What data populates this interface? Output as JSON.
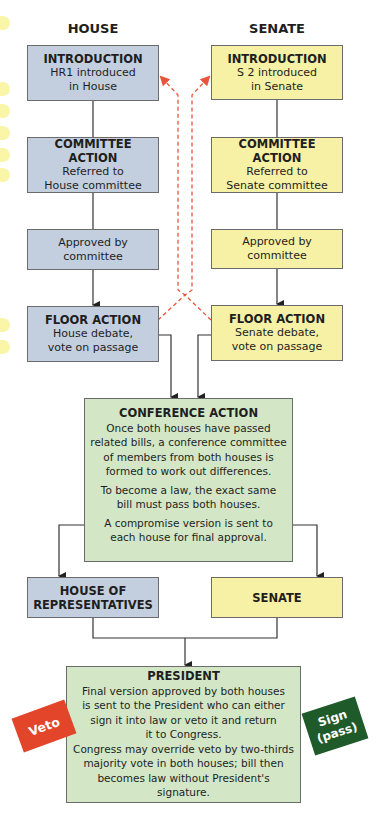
{
  "columns": {
    "house": {
      "label": "HOUSE",
      "color": "#c3cfdf"
    },
    "senate": {
      "label": "SENATE",
      "color": "#f6f1a4"
    }
  },
  "house_steps": [
    {
      "title": "INTRODUCTION",
      "body": "HR1 introduced\nin House"
    },
    {
      "title": "COMMITTEE ACTION",
      "body": "Referred to\nHouse committee"
    },
    {
      "title": "",
      "body": "Approved by\ncommittee"
    },
    {
      "title": "FLOOR ACTION",
      "body": "House debate,\nvote on passage"
    }
  ],
  "senate_steps": [
    {
      "title": "INTRODUCTION",
      "body": "S 2 introduced\nin Senate"
    },
    {
      "title": "COMMITTEE ACTION",
      "body": "Referred to\nSenate committee"
    },
    {
      "title": "",
      "body": "Approved by\ncommittee"
    },
    {
      "title": "FLOOR ACTION",
      "body": "Senate debate,\nvote on passage"
    }
  ],
  "conference": {
    "title": "CONFERENCE ACTION",
    "paragraphs": [
      "Once both houses have passed\nrelated bills, a conference committee\nof members from both houses is\nformed to work out differences.",
      "To become a law, the exact same\nbill must pass both houses.",
      "A compromise version is sent to\neach house for final approval."
    ],
    "color": "#d3e7c7"
  },
  "final_votes": {
    "house": "HOUSE OF\nREPRESENTATIVES",
    "senate": "SENATE"
  },
  "president": {
    "title": "PRESIDENT",
    "body": "Final version approved by both houses\nis sent to the President who can either\nsign it into law or veto it and return\nit to Congress.\nCongress may override veto by two-thirds\nmajority vote in both houses; bill then\nbecomes law without President's signature."
  },
  "badges": {
    "veto": {
      "label": "Veto",
      "color": "#e2452a"
    },
    "sign": {
      "label": "Sign\n(pass)",
      "color": "#1f5a2a"
    }
  },
  "colors": {
    "dashed_arrow": "#e8553a",
    "connector": "#333333"
  }
}
